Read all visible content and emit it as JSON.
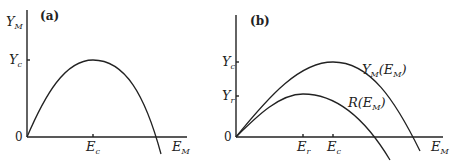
{
  "panels": [
    {
      "id": "a",
      "label": "(a)",
      "y_axis": {
        "name": "Y",
        "sub": "M"
      },
      "x_axis": {
        "name": "E",
        "sub": "M"
      },
      "origin_label": "0",
      "y_ticks": [
        {
          "name": "Y",
          "sub": "c"
        }
      ],
      "x_ticks": [
        {
          "name": "E",
          "sub": "c"
        }
      ],
      "curves": [
        {
          "name": "Y_M(E_M)",
          "label": ""
        }
      ]
    },
    {
      "id": "b",
      "label": "(b)",
      "y_axis": {
        "name": "",
        "sub": ""
      },
      "x_axis": {
        "name": "E",
        "sub": "M"
      },
      "origin_label": "0",
      "y_ticks": [
        {
          "name": "Y",
          "sub": "c"
        },
        {
          "name": "Y",
          "sub": "r"
        }
      ],
      "x_ticks": [
        {
          "name": "E",
          "sub": "r"
        },
        {
          "name": "E",
          "sub": "c"
        }
      ],
      "curves": [
        {
          "name": "Y_M(E_M)",
          "label_main": "Y",
          "label_sub": "M",
          "label_arg": "(E",
          "label_arg_sub": "M",
          "label_close": ")"
        },
        {
          "name": "R(E_M)",
          "label_main": "R",
          "label_arg": "(E",
          "label_arg_sub": "M",
          "label_close": ")"
        }
      ]
    }
  ]
}
